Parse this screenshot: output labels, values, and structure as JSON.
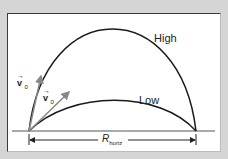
{
  "diagram": {
    "curves": [
      {
        "name": "High",
        "label": "High",
        "apex": [
          112,
          23
        ]
      },
      {
        "name": "Low",
        "label": "Low",
        "apex": [
          120,
          105
        ]
      }
    ],
    "vectors": [
      {
        "label": "v",
        "subscript": "0",
        "description": "steep launch velocity"
      },
      {
        "label": "v",
        "subscript": "0",
        "description": "shallow launch velocity"
      }
    ],
    "range_label": {
      "main": "R",
      "subscript": "horiz"
    },
    "colors": {
      "curve": "#1a1a1a",
      "vector": "#888888",
      "ground": "#555555",
      "background": "#d5d5d5",
      "panel": "#ffffff"
    }
  }
}
